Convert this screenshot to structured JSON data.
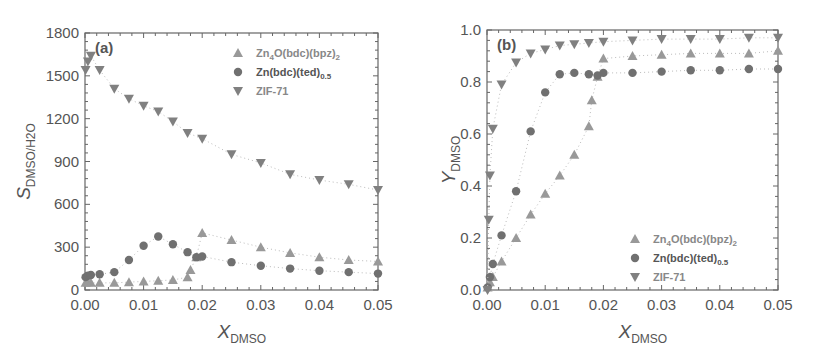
{
  "colors": {
    "triangle_up": "#999999",
    "circle": "#707070",
    "triangle_down": "#808080",
    "axis": "#666666",
    "text": "#555555"
  },
  "chart_data": [
    {
      "type": "scatter",
      "panel_label": "(a)",
      "title": "",
      "xlabel": "X_DMSO",
      "xlabel_main": "X",
      "xlabel_sub": "DMSO",
      "ylabel": "S_DMSO/H2O",
      "ylabel_main": "S",
      "ylabel_sub": "DMSO/H2O",
      "xlim": [
        0,
        0.05
      ],
      "ylim": [
        0,
        1800
      ],
      "xticks": [
        "0.00",
        "0.01",
        "0.02",
        "0.03",
        "0.04",
        "0.05"
      ],
      "yticks": [
        "0",
        "300",
        "600",
        "900",
        "1200",
        "1500",
        "1800"
      ],
      "grid": false,
      "legend_position": "upper right",
      "series": [
        {
          "name": "Zn4O(bdc)(bpz)2",
          "marker": "triangle-up",
          "x": [
            0.0001,
            0.0005,
            0.001,
            0.0025,
            0.005,
            0.0075,
            0.01,
            0.0125,
            0.015,
            0.0175,
            0.018,
            0.019,
            0.02,
            0.025,
            0.03,
            0.035,
            0.04,
            0.045,
            0.05
          ],
          "y": [
            50,
            55,
            50,
            50,
            50,
            55,
            60,
            65,
            70,
            90,
            140,
            230,
            400,
            350,
            300,
            260,
            230,
            210,
            200
          ]
        },
        {
          "name": "Zn(bdc)(ted)0.5",
          "marker": "circle",
          "x": [
            0.0001,
            0.0005,
            0.001,
            0.0025,
            0.005,
            0.0075,
            0.01,
            0.0125,
            0.015,
            0.0175,
            0.019,
            0.02,
            0.025,
            0.03,
            0.035,
            0.04,
            0.045,
            0.05
          ],
          "y": [
            90,
            100,
            105,
            110,
            125,
            210,
            310,
            375,
            320,
            265,
            230,
            235,
            195,
            170,
            150,
            135,
            125,
            115
          ]
        },
        {
          "name": "ZIF-71",
          "marker": "triangle-down",
          "x": [
            0.0001,
            0.0005,
            0.001,
            0.0025,
            0.005,
            0.0075,
            0.01,
            0.0125,
            0.015,
            0.0175,
            0.02,
            0.025,
            0.03,
            0.035,
            0.04,
            0.045,
            0.05
          ],
          "y": [
            1540,
            1600,
            1640,
            1540,
            1410,
            1340,
            1290,
            1250,
            1180,
            1100,
            1060,
            950,
            890,
            810,
            770,
            740,
            700
          ]
        }
      ]
    },
    {
      "type": "scatter",
      "panel_label": "(b)",
      "title": "",
      "xlabel": "X_DMSO",
      "xlabel_main": "X",
      "xlabel_sub": "DMSO",
      "ylabel": "Y_DMSO",
      "ylabel_main": "Y",
      "ylabel_sub": "DMSO",
      "xlim": [
        0,
        0.05
      ],
      "ylim": [
        0,
        1.0
      ],
      "xticks": [
        "0.00",
        "0.01",
        "0.02",
        "0.03",
        "0.04",
        "0.05"
      ],
      "yticks": [
        "0.0",
        "0.2",
        "0.4",
        "0.6",
        "0.8",
        "1.0"
      ],
      "grid": false,
      "legend_position": "lower right",
      "series": [
        {
          "name": "Zn4O(bdc)(bpz)2",
          "marker": "triangle-up",
          "x": [
            0.0001,
            0.0005,
            0.001,
            0.0025,
            0.005,
            0.0075,
            0.01,
            0.0125,
            0.015,
            0.0175,
            0.018,
            0.019,
            0.02,
            0.025,
            0.03,
            0.035,
            0.04,
            0.045,
            0.05
          ],
          "y": [
            0.01,
            0.03,
            0.05,
            0.11,
            0.2,
            0.29,
            0.37,
            0.44,
            0.52,
            0.63,
            0.73,
            0.82,
            0.89,
            0.9,
            0.905,
            0.91,
            0.91,
            0.91,
            0.92
          ]
        },
        {
          "name": "Zn(bdc)(ted)0.5",
          "marker": "circle",
          "x": [
            0.0001,
            0.0005,
            0.001,
            0.0025,
            0.005,
            0.0075,
            0.01,
            0.0125,
            0.015,
            0.0175,
            0.019,
            0.02,
            0.025,
            0.03,
            0.035,
            0.04,
            0.045,
            0.05
          ],
          "y": [
            0.01,
            0.05,
            0.1,
            0.21,
            0.38,
            0.61,
            0.76,
            0.83,
            0.835,
            0.83,
            0.825,
            0.835,
            0.835,
            0.84,
            0.845,
            0.845,
            0.85,
            0.85
          ]
        },
        {
          "name": "ZIF-71",
          "marker": "triangle-down",
          "x": [
            0.0001,
            0.0003,
            0.0005,
            0.001,
            0.0025,
            0.005,
            0.0075,
            0.01,
            0.0125,
            0.015,
            0.0175,
            0.02,
            0.025,
            0.03,
            0.035,
            0.04,
            0.045,
            0.05
          ],
          "y": [
            0.0,
            0.27,
            0.44,
            0.62,
            0.79,
            0.875,
            0.91,
            0.925,
            0.94,
            0.945,
            0.95,
            0.955,
            0.96,
            0.965,
            0.965,
            0.965,
            0.97,
            0.97
          ]
        }
      ]
    }
  ],
  "legend": [
    {
      "label_main": "Zn",
      "sub1": "4",
      "mid": "O(bdc)(bpz)",
      "sub2": "2"
    },
    {
      "label_main": "Zn(bdc)(ted)",
      "sub1": "0.5"
    },
    {
      "label_main": "ZIF-71"
    }
  ]
}
